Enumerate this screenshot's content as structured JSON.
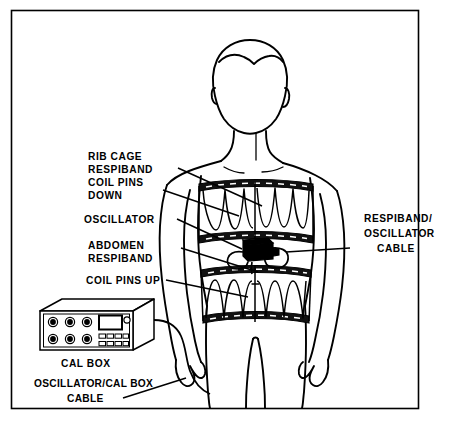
{
  "figure": {
    "type": "respiratory-inductance-plethysmography-placement-diagram",
    "border_color": "#000000",
    "line_color": "#000000",
    "background_color": "#ffffff"
  },
  "labels": {
    "rib_cage_respiband": {
      "lines": [
        "RIB CAGE",
        "RESPIBAND"
      ],
      "line1": "RIB CAGE",
      "line2": "RESPIBAND"
    },
    "coil_pins_down": {
      "lines": [
        "COIL PINS",
        "DOWN"
      ],
      "line1": "COIL PINS",
      "line2": "DOWN"
    },
    "oscillator": {
      "lines": [
        "OSCILLATOR"
      ],
      "line1": "OSCILLATOR"
    },
    "abdomen_respiband": {
      "lines": [
        "ABDOMEN",
        "RESPIBAND"
      ],
      "line1": "ABDOMEN",
      "line2": "RESPIBAND"
    },
    "coil_pins_up": {
      "lines": [
        "COIL PINS UP"
      ],
      "line1": "COIL PINS UP"
    },
    "respiband_oscillator_cable": {
      "lines": [
        "RESPIBAND/",
        "OSCILLATOR",
        "CABLE"
      ],
      "line1": "RESPIBAND/",
      "line2": "OSCILLATOR",
      "line3": "CABLE"
    },
    "cal_box": {
      "lines": [
        "CAL BOX"
      ],
      "line1": "CAL BOX"
    },
    "oscillator_cal_box_cable": {
      "lines": [
        "OSCILLATOR/CAL BOX",
        "CABLE"
      ],
      "line1": "OSCILLATOR/CAL BOX",
      "line2": "CABLE"
    }
  },
  "components": {
    "rib_cage_band": {
      "name": "rib cage respiband",
      "coil_direction": "down",
      "coil_count": 7
    },
    "abdomen_band": {
      "name": "abdomen respiband",
      "coil_direction": "up",
      "coil_count": 7
    },
    "oscillator_unit": {
      "name": "oscillator",
      "fill": "#000000"
    },
    "cal_box_unit": {
      "name": "cal box",
      "knob_count": 6,
      "knob_rows": 2,
      "knob_columns": 3,
      "display_panel": true,
      "indicator_light": true,
      "button_rows": 2,
      "buttons_per_row": 4
    }
  }
}
